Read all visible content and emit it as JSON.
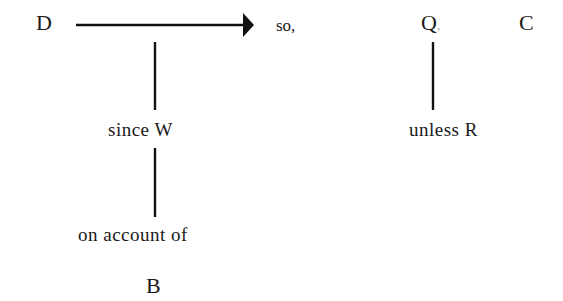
{
  "diagram": {
    "type": "toulmin-argument-model",
    "nodes": {
      "data": {
        "label": "D"
      },
      "connector_so": {
        "label": "so,"
      },
      "qualifier": {
        "label": "Q",
        "trailing_mark": ","
      },
      "claim": {
        "label": "C"
      },
      "warrant": {
        "label": "since W"
      },
      "backing_connector": {
        "label": "on account of"
      },
      "backing": {
        "label": "B"
      },
      "rebuttal": {
        "label": "unless R"
      }
    },
    "edges": [
      {
        "from": "D",
        "to": "C",
        "style": "arrow",
        "label": "so,"
      },
      {
        "from": "arrow",
        "to": "since W",
        "style": "line"
      },
      {
        "from": "since W",
        "to": "on account of",
        "style": "line"
      },
      {
        "from": "Q",
        "to": "unless R",
        "style": "line"
      }
    ],
    "colors": {
      "ink": "#1a1a1a",
      "background": "#ffffff"
    }
  }
}
